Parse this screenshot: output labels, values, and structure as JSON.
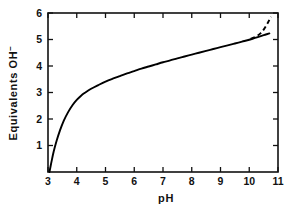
{
  "chart_data": {
    "type": "line",
    "title": "",
    "xlabel": "pH",
    "ylabel": "Equivalents OH",
    "ylabel_superscript": "−",
    "ylabel_full": "Equivalents OH⁻",
    "xlim": [
      3,
      11
    ],
    "ylim": [
      0,
      6
    ],
    "xticks": [
      3,
      4,
      5,
      6,
      7,
      8,
      9,
      10,
      11
    ],
    "xtick_labels": [
      "3",
      "4",
      "5",
      "6",
      "7",
      "8",
      "9",
      "10",
      "11"
    ],
    "yticks": [
      1,
      2,
      3,
      4,
      5,
      6
    ],
    "ytick_labels": [
      "1",
      "2",
      "3",
      "4",
      "5",
      "6"
    ],
    "grid": false,
    "legend": null,
    "frame": "box",
    "tick_direction": "in",
    "series": [
      {
        "name": "titration-curve",
        "style": "solid",
        "color": "#000000",
        "points": [
          [
            3.05,
            0.0
          ],
          [
            3.12,
            0.38
          ],
          [
            3.2,
            0.78
          ],
          [
            3.3,
            1.18
          ],
          [
            3.42,
            1.58
          ],
          [
            3.55,
            1.94
          ],
          [
            3.7,
            2.26
          ],
          [
            3.85,
            2.52
          ],
          [
            4.0,
            2.72
          ],
          [
            4.15,
            2.88
          ],
          [
            4.3,
            3.0
          ],
          [
            4.5,
            3.14
          ],
          [
            4.75,
            3.28
          ],
          [
            5.0,
            3.41
          ],
          [
            5.25,
            3.52
          ],
          [
            5.5,
            3.62
          ],
          [
            5.75,
            3.72
          ],
          [
            6.0,
            3.81
          ],
          [
            6.25,
            3.9
          ],
          [
            6.5,
            3.98
          ],
          [
            6.75,
            4.06
          ],
          [
            7.0,
            4.14
          ],
          [
            7.25,
            4.21
          ],
          [
            7.5,
            4.29
          ],
          [
            7.75,
            4.36
          ],
          [
            8.0,
            4.43
          ],
          [
            8.25,
            4.5
          ],
          [
            8.5,
            4.57
          ],
          [
            8.75,
            4.64
          ],
          [
            9.0,
            4.71
          ],
          [
            9.25,
            4.78
          ],
          [
            9.5,
            4.85
          ],
          [
            9.75,
            4.92
          ],
          [
            10.0,
            4.99
          ],
          [
            10.2,
            5.06
          ],
          [
            10.4,
            5.13
          ],
          [
            10.55,
            5.18
          ],
          [
            10.7,
            5.23
          ]
        ]
      },
      {
        "name": "extrapolated-branch",
        "style": "dashed",
        "color": "#000000",
        "points": [
          [
            10.05,
            5.02
          ],
          [
            10.25,
            5.12
          ],
          [
            10.4,
            5.24
          ],
          [
            10.52,
            5.4
          ],
          [
            10.62,
            5.58
          ],
          [
            10.7,
            5.74
          ],
          [
            10.76,
            5.86
          ]
        ]
      }
    ]
  },
  "axes_geometry": {
    "left_px": 48,
    "right_px": 278,
    "top_px": 13,
    "bottom_px": 172
  }
}
